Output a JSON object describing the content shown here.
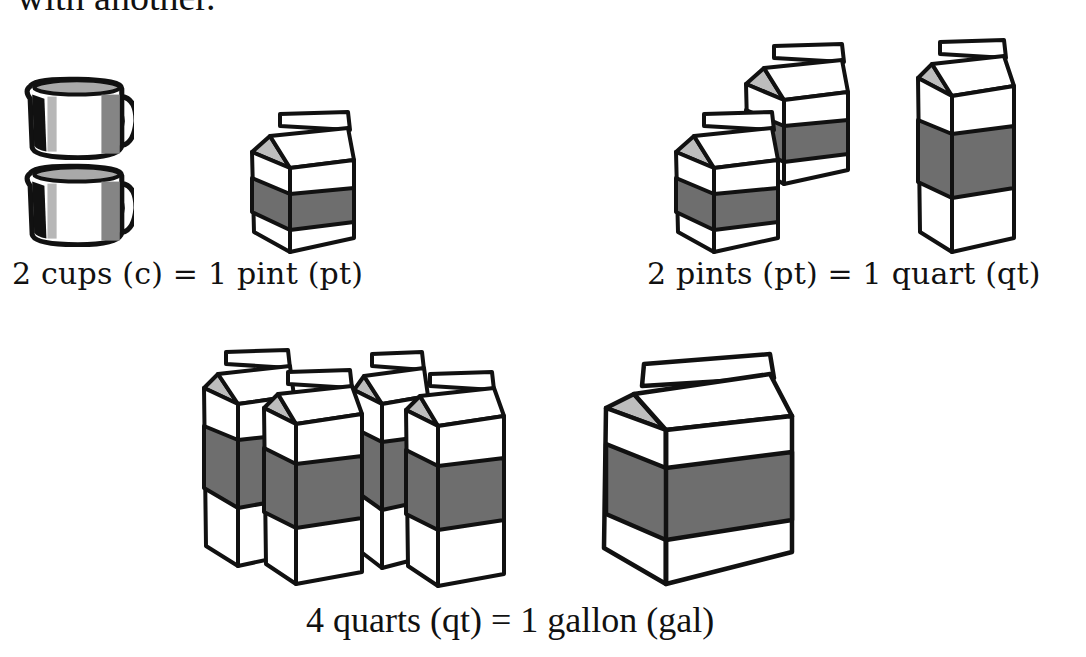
{
  "intro_text": "with another.",
  "colors": {
    "ink": "#111111",
    "band": "#6e6e6e",
    "spout": "#bdbdbd",
    "cup_side": "#a9a9a9",
    "cup_dark": "#7d7d7d",
    "paper": "#ffffff"
  },
  "conversions": [
    {
      "caption": "2 cups (c) = 1 pint (pt)",
      "from": {
        "count": 2,
        "unit": "cups",
        "abbr": "c",
        "icon": "measuring-cup-icon"
      },
      "to": {
        "count": 1,
        "unit": "pint",
        "abbr": "pt",
        "icon": "pint-carton-icon"
      }
    },
    {
      "caption": "2 pints (pt) = 1 quart (qt)",
      "from": {
        "count": 2,
        "unit": "pints",
        "abbr": "pt",
        "icon": "pint-carton-icon"
      },
      "to": {
        "count": 1,
        "unit": "quart",
        "abbr": "qt",
        "icon": "quart-carton-icon"
      }
    },
    {
      "caption": "4 quarts (qt) = 1 gallon (gal)",
      "from": {
        "count": 4,
        "unit": "quarts",
        "abbr": "qt",
        "icon": "quart-carton-icon"
      },
      "to": {
        "count": 1,
        "unit": "gallon",
        "abbr": "gal",
        "icon": "gallon-carton-icon"
      }
    }
  ]
}
